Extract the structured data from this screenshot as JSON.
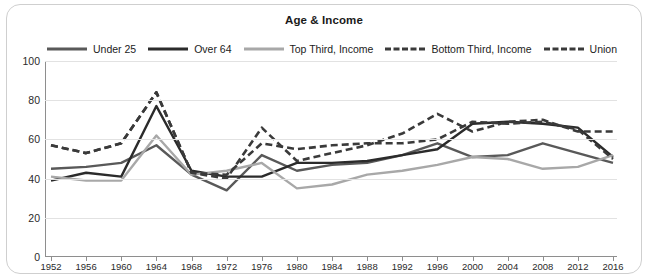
{
  "card": {
    "title": "Age & Income"
  },
  "legend": {
    "items": [
      {
        "label": "Under 25",
        "color": "#595959",
        "dash": "solid"
      },
      {
        "label": "Over 64",
        "color": "#2b2b2b",
        "dash": "solid"
      },
      {
        "label": "Top Third, Income",
        "color": "#a8a8a8",
        "dash": "solid"
      },
      {
        "label": "Bottom Third, Income",
        "color": "#3a3a3a",
        "dash": "dashed"
      },
      {
        "label": "Union",
        "color": "#3a3a3a",
        "dash": "dashed"
      }
    ]
  },
  "axes": {
    "y_ticks": [
      "100",
      "80",
      "60",
      "40",
      "20",
      "0"
    ],
    "x_ticks": [
      "1952",
      "1956",
      "1960",
      "1964",
      "1968",
      "1972",
      "1976",
      "1980",
      "1984",
      "1988",
      "1992",
      "1996",
      "2000",
      "2004",
      "2008",
      "2012",
      "2016"
    ]
  },
  "chart_data": {
    "type": "line",
    "title": "Age & Income",
    "xlabel": "",
    "ylabel": "",
    "ylim": [
      0,
      100
    ],
    "xlim": [
      1952,
      2016
    ],
    "grid": true,
    "legend_position": "top",
    "x": [
      1952,
      1956,
      1960,
      1964,
      1968,
      1972,
      1976,
      1980,
      1984,
      1988,
      1992,
      1996,
      2000,
      2004,
      2008,
      2012,
      2016
    ],
    "series": [
      {
        "name": "Under 25",
        "color": "#595959",
        "dash": "solid",
        "values": [
          45,
          46,
          48,
          57,
          42,
          34,
          52,
          44,
          47,
          48,
          52,
          58,
          51,
          52,
          58,
          53,
          48
        ]
      },
      {
        "name": "Over 64",
        "color": "#2b2b2b",
        "dash": "solid",
        "values": [
          39,
          43,
          41,
          77,
          44,
          41,
          41,
          48,
          48,
          49,
          52,
          55,
          68,
          69,
          68,
          66,
          51
        ]
      },
      {
        "name": "Top Third, Income",
        "color": "#a8a8a8",
        "dash": "solid",
        "values": [
          41,
          39,
          39,
          62,
          42,
          44,
          48,
          35,
          37,
          42,
          44,
          47,
          51,
          50,
          45,
          46,
          52
        ]
      },
      {
        "name": "Bottom Third, Income",
        "color": "#3a3a3a",
        "dash": "dashed",
        "values": [
          57,
          53,
          58,
          84,
          43,
          40,
          66,
          49,
          53,
          57,
          63,
          73,
          64,
          69,
          70,
          64,
          64
        ]
      },
      {
        "name": "Union",
        "color": "#3a3a3a",
        "dash": "dashed",
        "values": [
          57,
          53,
          58,
          84,
          43,
          42,
          58,
          55,
          57,
          58,
          58,
          60,
          69,
          68,
          69,
          65,
          50
        ]
      }
    ]
  }
}
